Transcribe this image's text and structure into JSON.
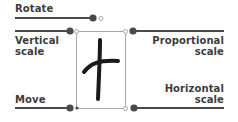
{
  "labels": {
    "rotate": "Rotate",
    "vertical_1": "Vertical",
    "vertical_2": "scale",
    "proportional_1": "Proportional",
    "proportional_2": "scale",
    "move": "Move",
    "horizontal_1": "Horizontal",
    "horizontal_2": "scale"
  },
  "glyph": "handwritten-t",
  "colors": {
    "line": "#4a4a4a",
    "box": "#9a9a9a",
    "text": "#3c3c3c",
    "stroke": "#1a1a1a"
  }
}
